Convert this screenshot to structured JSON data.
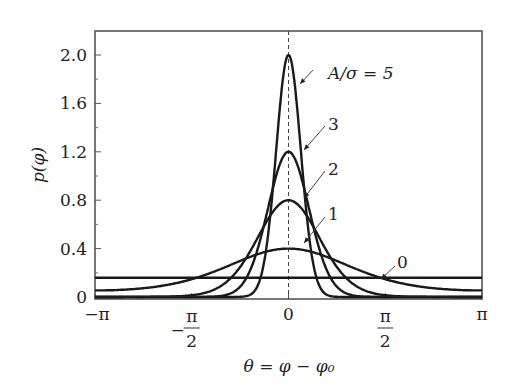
{
  "chart_data": {
    "type": "line",
    "title": "",
    "xlabel": "θ = φ − φ₀",
    "ylabel": "p(φ)",
    "xlim": [
      -3.14159,
      3.14159
    ],
    "ylim": [
      0,
      2.2
    ],
    "grid": false,
    "legend": "inline annotations with arrows",
    "x_ticks": [
      {
        "value": -3.14159,
        "label": "−π"
      },
      {
        "value": -1.5708,
        "label": "−π/2"
      },
      {
        "value": 0,
        "label": "0"
      },
      {
        "value": 1.5708,
        "label": "π/2"
      },
      {
        "value": 3.14159,
        "label": "π"
      }
    ],
    "y_ticks": [
      {
        "value": 0,
        "label": "0"
      },
      {
        "value": 0.4,
        "label": "0.4"
      },
      {
        "value": 0.8,
        "label": "0.8"
      },
      {
        "value": 1.2,
        "label": "1.2"
      },
      {
        "value": 1.6,
        "label": "1.6"
      },
      {
        "value": 2.0,
        "label": "2.0"
      }
    ],
    "reference_line": {
      "x": 0,
      "style": "dashed"
    },
    "series": [
      {
        "name": "A/σ = 0",
        "label": "0",
        "peak": 0.159,
        "width": 0
      },
      {
        "name": "A/σ = 1",
        "label": "1",
        "peak": 0.4,
        "width": 1.0
      },
      {
        "name": "A/σ = 2",
        "label": "2",
        "peak": 0.8,
        "width": 0.5
      },
      {
        "name": "A/σ = 3",
        "label": "3",
        "peak": 1.2,
        "width": 0.333
      },
      {
        "name": "A/σ = 5",
        "label": "A/σ = 5",
        "peak": 2.0,
        "width": 0.2
      }
    ]
  }
}
